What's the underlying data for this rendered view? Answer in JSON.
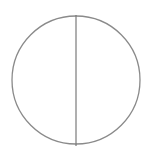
{
  "diagram": {
    "type": "circle-with-diameter",
    "circle": {
      "cx": 76,
      "cy": 80,
      "r": 64,
      "stroke": "#8a8a8a"
    },
    "diameter": {
      "x": 76,
      "y1": 15,
      "y2": 146,
      "stroke": "#7a7a7a"
    }
  }
}
